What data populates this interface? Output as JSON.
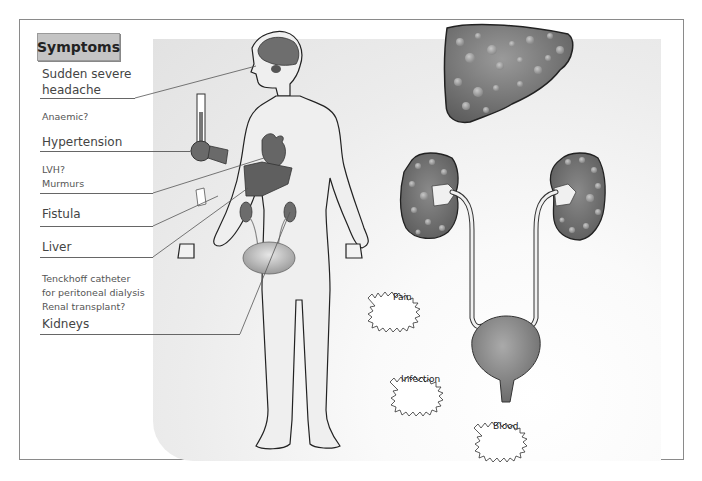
{
  "header": {
    "title": "Symptoms"
  },
  "labels": [
    {
      "id": "headache",
      "lines": [
        "Sudden severe",
        "headache"
      ],
      "size": "big"
    },
    {
      "id": "anaemic",
      "lines": [
        "Anaemic?"
      ],
      "size": "small"
    },
    {
      "id": "hypertension",
      "lines": [
        "Hypertension"
      ],
      "size": "big"
    },
    {
      "id": "lvh",
      "lines": [
        "LVH?",
        "Murmurs"
      ],
      "size": "small"
    },
    {
      "id": "fistula",
      "lines": [
        "Fistula"
      ],
      "size": "big"
    },
    {
      "id": "liver",
      "lines": [
        "Liver"
      ],
      "size": "big"
    },
    {
      "id": "tenckhoff",
      "lines": [
        "Tenckhoff catheter",
        "for peritoneal dialysis",
        "Renal transplant?"
      ],
      "size": "small"
    },
    {
      "id": "kidneys",
      "lines": [
        "Kidneys"
      ],
      "size": "big"
    }
  ],
  "bursts": [
    {
      "id": "pain",
      "label": "Pain"
    },
    {
      "id": "infection",
      "label": "Infection"
    },
    {
      "id": "blood",
      "label": "Blood"
    }
  ],
  "colors": {
    "organ": "#6f6f6f",
    "organ_dark": "#555555",
    "cyst": "#9c9c9c",
    "bladder": "#8a8a8a",
    "body_fill": "#ededed",
    "outline": "#222222"
  }
}
